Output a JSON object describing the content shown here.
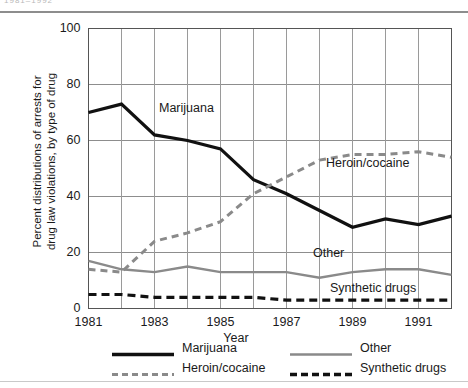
{
  "figure": {
    "top_caption": "1981–1992",
    "axis_titles": {
      "y_line1": "Percent distributions of arrests for",
      "y_line2": "drug law violations, by type of drug",
      "x": "Year"
    },
    "annotations": {
      "marijuana": "Marijuana",
      "heroin_cocaine": "Heroin/cocaine",
      "other": "Other",
      "synthetic_drugs": "Synthetic drugs"
    },
    "legend": [
      {
        "label": "Marijuana",
        "style": "solid-thick",
        "color": "#111111"
      },
      {
        "label": "Other",
        "style": "solid-medium",
        "color": "#8a8a8a"
      },
      {
        "label": "Heroin/cocaine",
        "style": "dashed",
        "color": "#8a8a8a"
      },
      {
        "label": "Synthetic drugs",
        "style": "dashed-thick",
        "color": "#111111"
      }
    ]
  },
  "chart_data": {
    "type": "line",
    "title": "",
    "subtitle": "",
    "xlabel": "Year",
    "ylabel": "Percent distributions of arrests for drug law violations, by type of drug",
    "xlim": [
      1981,
      1992
    ],
    "ylim": [
      0,
      100
    ],
    "yticks": [
      0,
      20,
      40,
      60,
      80,
      100
    ],
    "ytick_labels": [
      "0",
      "20",
      "40",
      "60",
      "80",
      "100"
    ],
    "xticks": [
      1981,
      1983,
      1985,
      1987,
      1989,
      1991
    ],
    "xtick_labels": [
      "1981",
      "1983",
      "1985",
      "1987",
      "1989",
      "1991"
    ],
    "grid": true,
    "legend_position": "below-axes",
    "x": [
      1981,
      1982,
      1983,
      1984,
      1985,
      1986,
      1987,
      1988,
      1989,
      1990,
      1991,
      1992
    ],
    "series": [
      {
        "name": "Marijuana",
        "color": "#111111",
        "dash": "none",
        "width": 3.2,
        "values": [
          70,
          73,
          62,
          60,
          57,
          46,
          41,
          35,
          29,
          32,
          30,
          33
        ]
      },
      {
        "name": "Heroin/cocaine",
        "color": "#8a8a8a",
        "dash": "7,5",
        "width": 3.0,
        "values": [
          14,
          13,
          24,
          27,
          31,
          41,
          47,
          53,
          55,
          55,
          56,
          54
        ]
      },
      {
        "name": "Other",
        "color": "#8a8a8a",
        "dash": "none",
        "width": 2.4,
        "values": [
          17,
          14,
          13,
          15,
          13,
          13,
          13,
          11,
          13,
          14,
          14,
          12
        ]
      },
      {
        "name": "Synthetic drugs",
        "color": "#111111",
        "dash": "8,5",
        "width": 3.2,
        "values": [
          5,
          5,
          4,
          4,
          4,
          4,
          3,
          3,
          3,
          3,
          3,
          3
        ]
      }
    ]
  }
}
